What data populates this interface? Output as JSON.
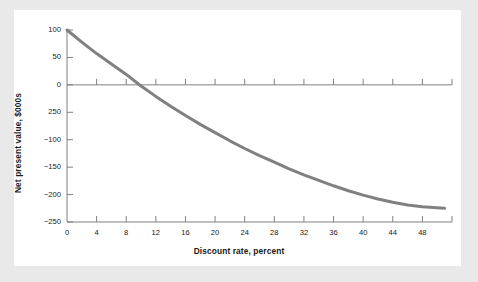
{
  "figure": {
    "background_color": "#e9e9e9",
    "panel_color": "#ffffff"
  },
  "chart_data": {
    "type": "line",
    "title": "",
    "xlabel": "Discount rate, percent",
    "ylabel": "Net present value, $000s",
    "xlim": [
      0,
      52
    ],
    "ylim": [
      -250,
      100
    ],
    "grid": false,
    "legend": null,
    "series": [
      {
        "name": "Net present value",
        "color": "#808080",
        "line_width": 3,
        "x": [
          0,
          2,
          4,
          6,
          8,
          10,
          12,
          14,
          16,
          18,
          20,
          22,
          24,
          26,
          28,
          30,
          32,
          34,
          36,
          38,
          40,
          42,
          44,
          46,
          48,
          50,
          51
        ],
        "y": [
          100,
          78,
          57,
          38,
          19,
          -2,
          -21,
          -39,
          -56,
          -72,
          -87,
          -102,
          -116,
          -129,
          -141,
          -153,
          -164,
          -174,
          -184,
          -193,
          -201,
          -208,
          -214,
          -219,
          -222,
          -224,
          -225
        ]
      }
    ],
    "x_ticks_major": [
      0,
      4,
      8,
      12,
      16,
      20,
      24,
      28,
      32,
      36,
      40,
      44,
      48
    ],
    "x_tick_labels": [
      "0",
      "4",
      "8",
      "12",
      "16",
      "20",
      "24",
      "28",
      "32",
      "36",
      "40",
      "44",
      "48"
    ],
    "y_ticks_major": [
      100,
      50,
      0,
      -50,
      -100,
      -150,
      -200,
      -250
    ],
    "y_tick_labels": [
      "100",
      "50",
      "0",
      "250",
      "−100",
      "−150",
      "−200",
      "−250"
    ],
    "zero_line": {
      "value": 0,
      "color": "#808080",
      "ticks_at": [
        4,
        8,
        12,
        16,
        20,
        24,
        28,
        32,
        36,
        40,
        44,
        48
      ]
    },
    "axis_color": "#808080",
    "zero_crossing_x": 9.8,
    "annotations": []
  }
}
